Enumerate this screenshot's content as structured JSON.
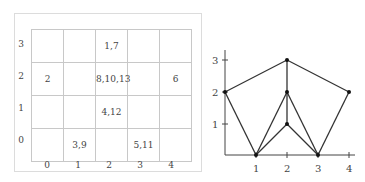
{
  "table": {
    "row_labels": [
      "3",
      "2",
      "1",
      "0"
    ],
    "col_labels": [
      "0",
      "1",
      "2",
      "3",
      "4"
    ],
    "cells": [
      [
        "",
        "",
        "1,7",
        "",
        ""
      ],
      [
        "2",
        "",
        "8,10,13",
        "",
        "6"
      ],
      [
        "",
        "",
        "4,12",
        "",
        ""
      ],
      [
        "",
        "3,9",
        "",
        "5,11",
        ""
      ]
    ]
  },
  "graph": {
    "x_ticks": [
      "1",
      "2",
      "3",
      "4"
    ],
    "y_ticks": [
      "1",
      "2",
      "3"
    ],
    "vertices": [
      [
        0,
        2
      ],
      [
        2,
        3
      ],
      [
        4,
        2
      ],
      [
        2,
        2
      ],
      [
        2,
        1
      ],
      [
        1,
        0
      ],
      [
        3,
        0
      ]
    ],
    "edges": [
      [
        [
          0,
          2
        ],
        [
          2,
          3
        ]
      ],
      [
        [
          2,
          3
        ],
        [
          4,
          2
        ]
      ],
      [
        [
          2,
          3
        ],
        [
          2,
          2
        ]
      ],
      [
        [
          2,
          2
        ],
        [
          2,
          1
        ]
      ],
      [
        [
          0,
          2
        ],
        [
          1,
          0
        ]
      ],
      [
        [
          1,
          0
        ],
        [
          2,
          2
        ]
      ],
      [
        [
          1,
          0
        ],
        [
          2,
          1
        ]
      ],
      [
        [
          2,
          2
        ],
        [
          3,
          0
        ]
      ],
      [
        [
          2,
          1
        ],
        [
          3,
          0
        ]
      ],
      [
        [
          3,
          0
        ],
        [
          4,
          2
        ]
      ]
    ]
  }
}
